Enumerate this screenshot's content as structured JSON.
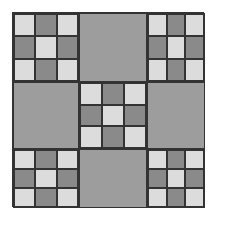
{
  "figure": {
    "colors": {
      "light": "#dcdcdc",
      "dark": "#8a8a8a",
      "solid": "#9d9d9d",
      "border": "#333333"
    },
    "blocks": [
      {
        "type": "nine",
        "pattern": [
          "light",
          "dark",
          "light",
          "dark",
          "light",
          "dark",
          "light",
          "dark",
          "light"
        ]
      },
      {
        "type": "solid"
      },
      {
        "type": "nine",
        "pattern": [
          "light",
          "dark",
          "light",
          "dark",
          "light",
          "dark",
          "light",
          "dark",
          "light"
        ]
      },
      {
        "type": "solid"
      },
      {
        "type": "nine",
        "pattern": [
          "light",
          "dark",
          "light",
          "dark",
          "light",
          "dark",
          "light",
          "dark",
          "light"
        ]
      },
      {
        "type": "solid"
      },
      {
        "type": "nine",
        "pattern": [
          "light",
          "dark",
          "light",
          "dark",
          "light",
          "dark",
          "light",
          "dark",
          "light"
        ]
      },
      {
        "type": "solid"
      },
      {
        "type": "nine",
        "pattern": [
          "light",
          "dark",
          "light",
          "dark",
          "light",
          "dark",
          "light",
          "dark",
          "light"
        ]
      }
    ]
  }
}
